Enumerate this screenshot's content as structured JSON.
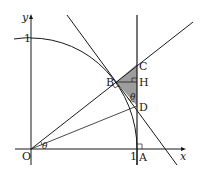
{
  "figure": {
    "axes": {
      "x_label": "x",
      "y_label": "y",
      "origin_label": "O",
      "x_tick_label": "1",
      "y_tick_label": "1"
    },
    "points": {
      "A": "A",
      "B": "B",
      "C": "C",
      "D": "D",
      "H": "H"
    },
    "angles": {
      "at_O": "θ",
      "at_D": "θ"
    },
    "colors": {
      "line": "#1a1a1a",
      "shade": "#8c8c8c"
    }
  }
}
